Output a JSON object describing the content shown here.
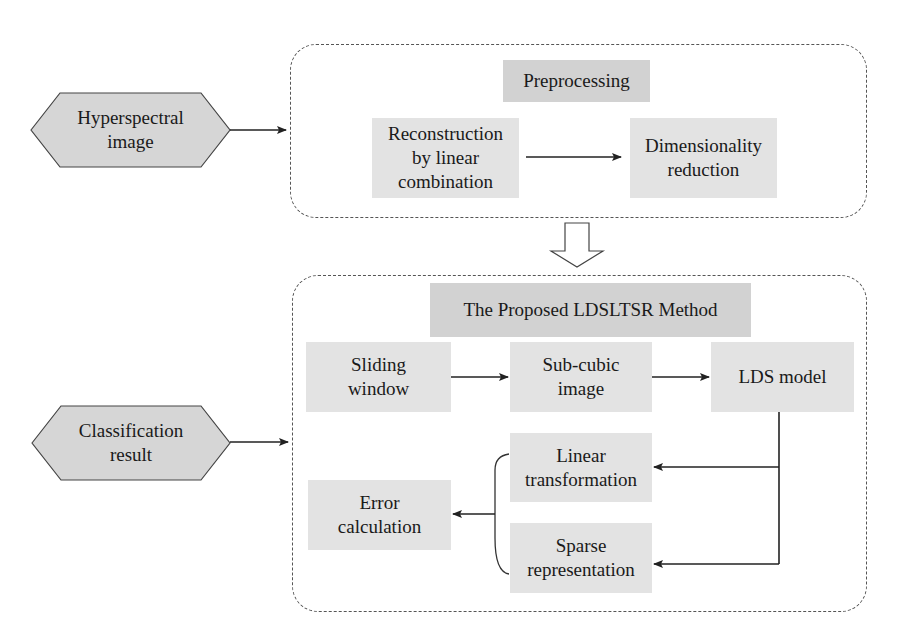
{
  "diagram": {
    "type": "flowchart",
    "colors": {
      "node_fill": "#e3e3e3",
      "title_fill": "#d2d2d2",
      "hexagon_fill": "#d6d6d6",
      "stroke": "#333333",
      "dashed_border": "#555555"
    },
    "inputs": {
      "hyperspectral": {
        "label": "Hyperspectral\nimage"
      },
      "classification": {
        "label": "Classification\nresult"
      }
    },
    "preprocessing": {
      "title": "Preprocessing",
      "steps": [
        {
          "label": "Reconstruction\nby linear\ncombination"
        },
        {
          "label": "Dimensionality\nreduction"
        }
      ]
    },
    "method": {
      "title": "The Proposed LDSLTSR Method",
      "steps": [
        {
          "label": "Sliding\nwindow"
        },
        {
          "label": "Sub-cubic\nimage"
        },
        {
          "label": "LDS model"
        },
        {
          "label": "Linear\ntransformation"
        },
        {
          "label": "Sparse\nrepresentation"
        },
        {
          "label": "Error\ncalculation"
        }
      ]
    },
    "edges": [
      {
        "from": "Hyperspectral image",
        "to": "Preprocessing"
      },
      {
        "from": "Reconstruction by linear combination",
        "to": "Dimensionality reduction"
      },
      {
        "from": "Preprocessing",
        "to": "The Proposed LDSLTSR Method"
      },
      {
        "from": "Sliding window",
        "to": "Sub-cubic image"
      },
      {
        "from": "Sub-cubic image",
        "to": "LDS model"
      },
      {
        "from": "LDS model",
        "to": "Linear transformation"
      },
      {
        "from": "LDS model",
        "to": "Sparse representation"
      },
      {
        "from": "Linear transformation + Sparse representation",
        "to": "Error calculation"
      },
      {
        "from": "Classification result",
        "to": "The Proposed LDSLTSR Method"
      }
    ]
  }
}
